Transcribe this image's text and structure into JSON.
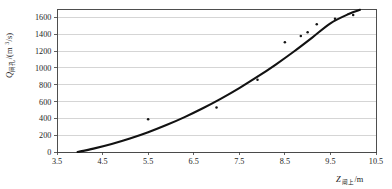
{
  "chart_data": {
    "type": "scatter",
    "title": "",
    "subtitle": "",
    "xlabel": "Z闸上/m",
    "xlabel_symbol": "Z",
    "xlabel_subscript": "闸上",
    "xlabel_unit": "/m",
    "ylabel": "Q闸孔/(m³/s)",
    "ylabel_symbol": "Q",
    "ylabel_subscript": "闸孔",
    "ylabel_unit": "/(m3/s)",
    "ylabel_unit_base": "/(m",
    "ylabel_unit_exp": "3",
    "ylabel_unit_tail": "/s)",
    "xlim": [
      3.5,
      10.5
    ],
    "ylim": [
      0,
      1700
    ],
    "xticks": [
      3.5,
      4.5,
      5.5,
      6.5,
      7.5,
      8.5,
      9.5,
      10.5
    ],
    "xtick_labels": [
      "3.5",
      "4.5",
      "5.5",
      "6.5",
      "7.5",
      "8.5",
      "9.5",
      "10.5"
    ],
    "yticks": [
      0,
      200,
      400,
      600,
      800,
      1000,
      1200,
      1400,
      1600
    ],
    "ytick_labels": [
      "0",
      "200",
      "400",
      "600",
      "800",
      "1000",
      "1200",
      "1400",
      "1600"
    ],
    "grid": true,
    "grid_axis": "y",
    "legend": false,
    "legend_position": "none",
    "series": [
      {
        "name": "measured-points",
        "type": "scatter",
        "marker": "dot",
        "color": "#151515",
        "points": [
          {
            "x": 5.5,
            "y": 390
          },
          {
            "x": 7.0,
            "y": 530
          },
          {
            "x": 7.9,
            "y": 860
          },
          {
            "x": 8.5,
            "y": 1305
          },
          {
            "x": 8.85,
            "y": 1380
          },
          {
            "x": 9.0,
            "y": 1425
          },
          {
            "x": 9.2,
            "y": 1520
          },
          {
            "x": 9.6,
            "y": 1585
          },
          {
            "x": 10.0,
            "y": 1630
          }
        ]
      },
      {
        "name": "fitted-curve",
        "type": "line",
        "color": "#121212",
        "points": [
          {
            "x": 3.95,
            "y": 0
          },
          {
            "x": 4.3,
            "y": 40
          },
          {
            "x": 4.7,
            "y": 95
          },
          {
            "x": 5.1,
            "y": 160
          },
          {
            "x": 5.5,
            "y": 235
          },
          {
            "x": 5.9,
            "y": 320
          },
          {
            "x": 6.3,
            "y": 415
          },
          {
            "x": 6.7,
            "y": 520
          },
          {
            "x": 7.1,
            "y": 635
          },
          {
            "x": 7.5,
            "y": 760
          },
          {
            "x": 7.9,
            "y": 895
          },
          {
            "x": 8.3,
            "y": 1040
          },
          {
            "x": 8.7,
            "y": 1195
          },
          {
            "x": 9.1,
            "y": 1360
          },
          {
            "x": 9.5,
            "y": 1530
          },
          {
            "x": 9.9,
            "y": 1640
          },
          {
            "x": 10.15,
            "y": 1690
          }
        ]
      }
    ]
  },
  "plot_geometry": {
    "left": 57,
    "right": 376,
    "top": 9,
    "bottom": 152
  }
}
